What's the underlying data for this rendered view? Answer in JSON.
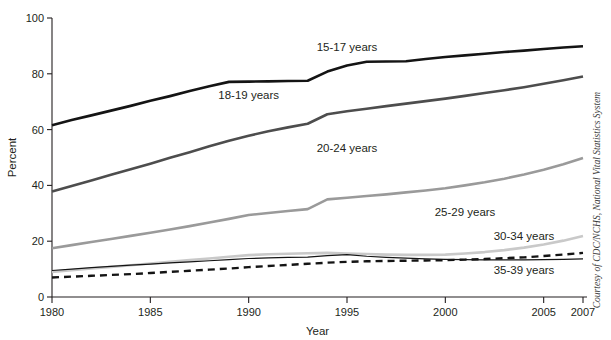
{
  "chart_data": {
    "type": "line",
    "title": "",
    "subtitle": "",
    "xlabel": "Year",
    "ylabel": "Percent",
    "xlim": [
      1980,
      2007
    ],
    "ylim": [
      0,
      100
    ],
    "grid": false,
    "legend_position": "inline-labels",
    "xticks": [
      1980,
      1985,
      1990,
      1995,
      2000,
      2005,
      2007
    ],
    "xtick_labels": [
      "1980",
      "1985",
      "1990",
      "1995",
      "2000",
      "2005",
      "2007"
    ],
    "yticks": [
      0,
      20,
      40,
      60,
      80,
      100
    ],
    "ytick_labels": [
      "0",
      "20",
      "40",
      "60",
      "80",
      "100"
    ],
    "x": [
      1980,
      1981,
      1982,
      1983,
      1984,
      1985,
      1986,
      1987,
      1988,
      1989,
      1990,
      1991,
      1992,
      1993,
      1994,
      1995,
      1996,
      1997,
      1998,
      1999,
      2000,
      2001,
      2002,
      2003,
      2004,
      2005,
      2006,
      2007
    ],
    "series": [
      {
        "name": "15-17 years",
        "label": "15-17 years",
        "color": "#141414",
        "width": 2.6,
        "dash": "",
        "label_x": 1995,
        "label_y": 88,
        "values": [
          61.6,
          63.4,
          65.1,
          66.8,
          68.5,
          70.3,
          72.0,
          73.8,
          75.5,
          77.1,
          77.2,
          77.3,
          77.4,
          77.5,
          80.8,
          83.0,
          84.3,
          84.4,
          84.5,
          85.3,
          86.0,
          86.6,
          87.2,
          87.8,
          88.3,
          88.9,
          89.4,
          89.9
        ]
      },
      {
        "name": "18-19 years",
        "label": "18-19 years",
        "color": "#4d4d4d",
        "width": 2.6,
        "dash": "",
        "label_x": 1990,
        "label_y": 71,
        "values": [
          37.8,
          39.8,
          41.8,
          43.8,
          45.8,
          47.8,
          49.9,
          51.9,
          54.0,
          56.0,
          57.8,
          59.4,
          60.8,
          62.1,
          65.5,
          66.6,
          67.5,
          68.4,
          69.3,
          70.2,
          71.1,
          72.1,
          73.1,
          74.1,
          75.2,
          76.4,
          77.7,
          79.0
        ]
      },
      {
        "name": "20-24 years",
        "label": "20-24 years",
        "color": "#9a9a9a",
        "width": 2.6,
        "dash": "",
        "label_x": 1995,
        "label_y": 52,
        "values": [
          17.5,
          18.6,
          19.7,
          20.8,
          21.9,
          23.0,
          24.2,
          25.4,
          26.7,
          28.0,
          29.4,
          30.1,
          30.8,
          31.5,
          35.0,
          35.6,
          36.2,
          36.8,
          37.5,
          38.2,
          39.0,
          40.0,
          41.1,
          42.4,
          43.9,
          45.6,
          47.6,
          49.8
        ]
      },
      {
        "name": "25-29 years",
        "label": "25-29 years",
        "color": "#c9c9c9",
        "width": 2.6,
        "dash": "",
        "label_x": 2001,
        "label_y": 29,
        "values": [
          9.0,
          9.6,
          10.2,
          10.8,
          11.4,
          12.0,
          12.6,
          13.2,
          13.8,
          14.4,
          15.0,
          15.3,
          15.5,
          15.7,
          15.8,
          15.6,
          15.4,
          15.2,
          15.1,
          15.1,
          15.2,
          15.6,
          16.1,
          16.8,
          17.7,
          18.8,
          20.2,
          21.9
        ]
      },
      {
        "name": "30-34 years",
        "label": "30-34 years",
        "color": "#141414",
        "width": 1.2,
        "dash": "",
        "label_x": 2004,
        "label_y": 20.5,
        "values": [
          9.5,
          10.0,
          10.5,
          11.0,
          11.4,
          11.8,
          12.2,
          12.6,
          13.0,
          13.4,
          13.8,
          14.0,
          14.2,
          14.3,
          14.8,
          15.2,
          14.6,
          14.2,
          13.9,
          13.7,
          13.5,
          13.4,
          13.3,
          13.3,
          13.3,
          13.4,
          13.5,
          13.7
        ]
      },
      {
        "name": "35-39 years",
        "label": "35-39 years",
        "color": "#141414",
        "width": 2.4,
        "dash": "7,5",
        "label_x": 2004,
        "label_y": 8.2,
        "values": [
          7.0,
          7.3,
          7.6,
          7.9,
          8.2,
          8.6,
          9.0,
          9.4,
          9.8,
          10.2,
          10.7,
          11.1,
          11.5,
          11.9,
          12.3,
          12.6,
          12.8,
          12.9,
          13.0,
          13.1,
          13.2,
          13.4,
          13.6,
          13.9,
          14.2,
          14.7,
          15.2,
          15.8
        ]
      }
    ]
  },
  "credit": {
    "text": "Courtesy of CDC/NCHS, National Vital Statistics System"
  }
}
